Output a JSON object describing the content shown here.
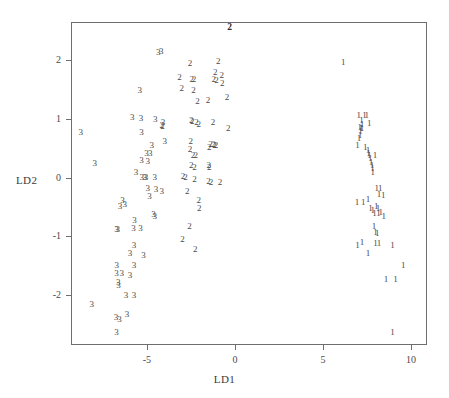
{
  "chart_data": {
    "type": "scatter",
    "title": "",
    "xlabel": "LD1",
    "ylabel": "LD2",
    "xlim": [
      -9.3,
      10.9
    ],
    "ylim": [
      -2.85,
      2.65
    ],
    "xticks": [
      -5,
      0,
      5,
      10
    ],
    "xticklabels": [
      "-5",
      "0",
      "5",
      "10"
    ],
    "yticks": [
      2,
      1,
      0,
      -1,
      -2
    ],
    "yticklabels": [
      "2",
      "1",
      "0",
      "-1",
      "-2"
    ],
    "grid": false,
    "legend": "none",
    "marker_style": "class-label-glyph",
    "classes": [
      "1",
      "2",
      "3"
    ],
    "annotations": [
      {
        "label": "2",
        "x": -0.3,
        "y": 2.56,
        "bold": true
      }
    ],
    "series": [
      {
        "name": "1",
        "label": "1",
        "points": [
          [
            6.15,
            1.97
          ],
          [
            7.03,
            1.06
          ],
          [
            7.35,
            1.07
          ],
          [
            7.48,
            1.07
          ],
          [
            7.18,
            0.98
          ],
          [
            7.22,
            0.92
          ],
          [
            7.62,
            0.93
          ],
          [
            7.08,
            0.86
          ],
          [
            7.22,
            0.85
          ],
          [
            7.15,
            0.84
          ],
          [
            7.12,
            0.79
          ],
          [
            7.1,
            0.72
          ],
          [
            7.05,
            0.68
          ],
          [
            6.95,
            0.56
          ],
          [
            7.4,
            0.52
          ],
          [
            7.55,
            0.47
          ],
          [
            7.58,
            0.42
          ],
          [
            7.62,
            0.38
          ],
          [
            7.95,
            0.38
          ],
          [
            7.68,
            0.33
          ],
          [
            7.72,
            0.27
          ],
          [
            7.78,
            0.22
          ],
          [
            7.8,
            0.17
          ],
          [
            7.82,
            0.1
          ],
          [
            8.05,
            -0.18
          ],
          [
            8.25,
            -0.18
          ],
          [
            8.18,
            -0.28
          ],
          [
            8.42,
            -0.3
          ],
          [
            6.92,
            -0.42
          ],
          [
            7.28,
            -0.42
          ],
          [
            7.55,
            -0.37
          ],
          [
            7.7,
            -0.52
          ],
          [
            7.82,
            -0.55
          ],
          [
            8.02,
            -0.48
          ],
          [
            8.12,
            -0.52
          ],
          [
            7.92,
            -0.6
          ],
          [
            8.15,
            -0.6
          ],
          [
            8.28,
            -0.58
          ],
          [
            8.45,
            -0.65
          ],
          [
            7.9,
            -0.82
          ],
          [
            7.98,
            -0.92
          ],
          [
            8.08,
            -0.95
          ],
          [
            6.95,
            -1.15
          ],
          [
            7.22,
            -1.1
          ],
          [
            7.98,
            -1.12
          ],
          [
            8.18,
            -1.12
          ],
          [
            8.95,
            -1.15
          ],
          [
            7.55,
            -1.28
          ],
          [
            9.55,
            -1.48
          ],
          [
            8.58,
            -1.72
          ],
          [
            9.12,
            -1.72
          ],
          [
            8.95,
            -2.62
          ]
        ]
      },
      {
        "name": "2",
        "label": "2",
        "points": [
          [
            -2.55,
            1.95
          ],
          [
            -0.95,
            1.98
          ],
          [
            -3.15,
            1.72
          ],
          [
            -1.12,
            1.8
          ],
          [
            -0.75,
            1.75
          ],
          [
            -2.45,
            1.68
          ],
          [
            -2.32,
            1.68
          ],
          [
            -1.2,
            1.68
          ],
          [
            -1.05,
            1.67
          ],
          [
            -0.72,
            1.62
          ],
          [
            -3.02,
            1.52
          ],
          [
            -2.35,
            1.5
          ],
          [
            -0.45,
            1.38
          ],
          [
            -2.12,
            1.3
          ],
          [
            -1.52,
            1.32
          ],
          [
            -2.48,
            0.98
          ],
          [
            -2.42,
            0.97
          ],
          [
            -2.18,
            0.95
          ],
          [
            -2.05,
            0.92
          ],
          [
            -1.25,
            0.95
          ],
          [
            -4.15,
            0.9
          ],
          [
            -4.1,
            0.88
          ],
          [
            -0.38,
            0.85
          ],
          [
            -2.5,
            0.62
          ],
          [
            -1.38,
            0.58
          ],
          [
            -1.22,
            0.57
          ],
          [
            -1.15,
            0.55
          ],
          [
            -1.08,
            0.55
          ],
          [
            -2.55,
            0.48
          ],
          [
            -1.45,
            0.52
          ],
          [
            -2.38,
            0.38
          ],
          [
            -2.22,
            0.38
          ],
          [
            -2.48,
            0.22
          ],
          [
            -2.3,
            0.18
          ],
          [
            -1.48,
            0.22
          ],
          [
            -1.45,
            0.18
          ],
          [
            -2.95,
            0.03
          ],
          [
            -2.8,
            0.02
          ],
          [
            -2.3,
            -0.02
          ],
          [
            -1.5,
            -0.05
          ],
          [
            -1.35,
            -0.07
          ],
          [
            -0.85,
            -0.07
          ],
          [
            -2.7,
            -0.22
          ],
          [
            -2.05,
            -0.38
          ],
          [
            -2.02,
            -0.52
          ],
          [
            -2.58,
            -0.82
          ],
          [
            -2.98,
            -1.05
          ],
          [
            -2.25,
            -1.22
          ]
        ]
      },
      {
        "name": "3",
        "label": "3",
        "points": [
          [
            -4.35,
            2.14
          ],
          [
            -4.18,
            2.15
          ],
          [
            -5.4,
            1.5
          ],
          [
            -5.82,
            1.03
          ],
          [
            -5.32,
            1.02
          ],
          [
            -4.52,
            1.0
          ],
          [
            -4.08,
            0.95
          ],
          [
            -8.75,
            0.78
          ],
          [
            -5.3,
            0.78
          ],
          [
            -4.72,
            0.55
          ],
          [
            -3.98,
            0.62
          ],
          [
            -5.02,
            0.42
          ],
          [
            -4.8,
            0.42
          ],
          [
            -5.3,
            0.3
          ],
          [
            -4.95,
            0.28
          ],
          [
            -7.95,
            0.25
          ],
          [
            -5.62,
            0.1
          ],
          [
            -5.28,
            0.02
          ],
          [
            -5.12,
            0.02
          ],
          [
            -5.05,
            0.02
          ],
          [
            -4.55,
            0.02
          ],
          [
            -4.95,
            -0.18
          ],
          [
            -4.48,
            -0.2
          ],
          [
            -4.15,
            -0.22
          ],
          [
            -6.38,
            -0.38
          ],
          [
            -4.85,
            -0.32
          ],
          [
            -6.52,
            -0.48
          ],
          [
            -6.25,
            -0.45
          ],
          [
            -4.62,
            -0.62
          ],
          [
            -4.55,
            -0.65
          ],
          [
            -5.7,
            -0.72
          ],
          [
            -6.72,
            -0.88
          ],
          [
            -6.65,
            -0.88
          ],
          [
            -5.75,
            -0.85
          ],
          [
            -5.35,
            -0.85
          ],
          [
            -5.72,
            -1.15
          ],
          [
            -5.95,
            -1.28
          ],
          [
            -5.18,
            -1.32
          ],
          [
            -6.7,
            -1.48
          ],
          [
            -5.72,
            -1.48
          ],
          [
            -6.72,
            -1.62
          ],
          [
            -6.42,
            -1.62
          ],
          [
            -5.95,
            -1.65
          ],
          [
            -6.62,
            -1.78
          ],
          [
            -6.6,
            -1.82
          ],
          [
            -6.18,
            -2.0
          ],
          [
            -5.72,
            -2.0
          ],
          [
            -8.12,
            -2.15
          ],
          [
            -6.75,
            -2.38
          ],
          [
            -6.55,
            -2.4
          ],
          [
            -6.12,
            -2.32
          ],
          [
            -6.72,
            -2.62
          ]
        ]
      }
    ]
  },
  "axis": {
    "x_title": "LD1",
    "y_title": "LD2"
  }
}
